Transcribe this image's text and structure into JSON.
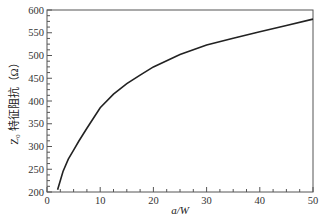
{
  "chart_data": {
    "type": "line",
    "title": "",
    "xlabel": "a/W",
    "ylabel": "Z₀ 特征阻抗（Ω）",
    "xlim": [
      0,
      50
    ],
    "ylim": [
      200,
      600
    ],
    "x_ticks": [
      0,
      10,
      20,
      30,
      40,
      50
    ],
    "y_ticks": [
      200,
      250,
      300,
      350,
      400,
      450,
      500,
      550,
      600
    ],
    "x_minor_step": 2.5,
    "y_minor_step": 12.5,
    "grid": false,
    "legend": null,
    "series": [
      {
        "name": "Z0",
        "color": "#222222",
        "x": [
          2,
          3,
          4,
          5,
          6,
          7.5,
          10,
          12.5,
          15,
          17.5,
          20,
          25,
          30,
          35,
          40,
          45,
          50
        ],
        "y": [
          205,
          245,
          272,
          292,
          312,
          340,
          385,
          415,
          438,
          457,
          475,
          502,
          523,
          538,
          552,
          566,
          580
        ]
      }
    ]
  }
}
